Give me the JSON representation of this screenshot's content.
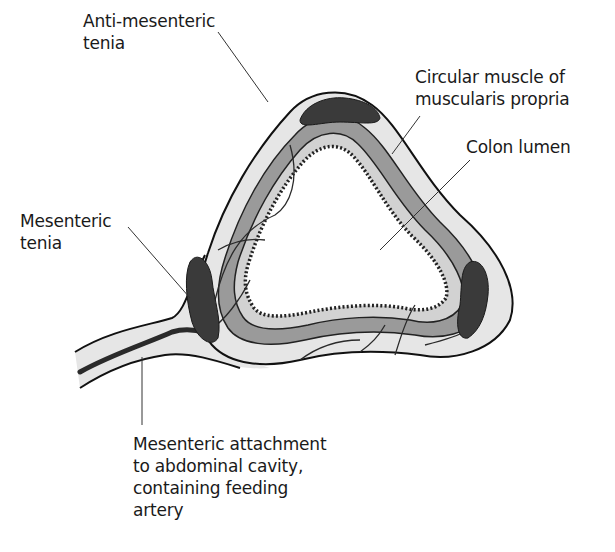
{
  "diagram": {
    "labels": {
      "anti_mesenteric_tenia": "Anti-mesenteric\ntenia",
      "circular_muscle": "Circular muscle of\nmuscularis propria",
      "colon_lumen": "Colon lumen",
      "mesenteric_tenia": "Mesenteric\ntenia",
      "mesenteric_attachment": "Mesenteric attachment\nto abdominal cavity,\ncontaining feeding\nartery"
    },
    "colors": {
      "serosa": "#e6e6e6",
      "muscle": "#9a9a9a",
      "submucosa": "#d2d2d2",
      "tenia": "#3a3a3a",
      "outline": "#111111",
      "lumen": "#ffffff",
      "vessel": "#2a2a2a"
    }
  }
}
